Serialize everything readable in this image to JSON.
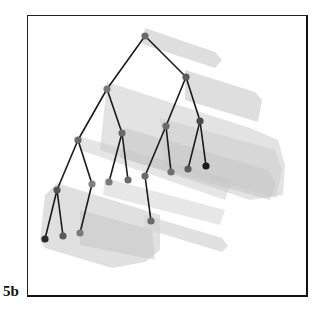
{
  "figure": {
    "label": "5b",
    "type": "3D tree with translucent cylinder/box segments",
    "colors": {
      "edge": "#1a1a1a",
      "node_fill": "#6f6f6f",
      "leaf_dark": "#1a1a1a",
      "shadow_light": "#d0d0d0",
      "frame": "#1a1a1a"
    }
  },
  "tree": {
    "nodes": [
      {
        "id": "root",
        "x": 145,
        "y": 36,
        "shade": "#6a6a6a"
      },
      {
        "id": "l1",
        "x": 107,
        "y": 89,
        "shade": "#7a7a7a"
      },
      {
        "id": "r1",
        "x": 186,
        "y": 77,
        "shade": "#5c5c5c"
      },
      {
        "id": "ll",
        "x": 78,
        "y": 140,
        "shade": "#6a6a6a"
      },
      {
        "id": "lr",
        "x": 122,
        "y": 133,
        "shade": "#6a6a6a"
      },
      {
        "id": "lr_a",
        "x": 109,
        "y": 182,
        "shade": "#7a7a7a"
      },
      {
        "id": "lr_b",
        "x": 128,
        "y": 180,
        "shade": "#6a6a6a"
      },
      {
        "id": "lll",
        "x": 57,
        "y": 190,
        "shade": "#555555"
      },
      {
        "id": "llr",
        "x": 92,
        "y": 184,
        "shade": "#808080"
      },
      {
        "id": "lll_a",
        "x": 45,
        "y": 239,
        "shade": "#2a2a2a"
      },
      {
        "id": "lll_b",
        "x": 63,
        "y": 236,
        "shade": "#5a5a5a"
      },
      {
        "id": "llr_a",
        "x": 80,
        "y": 233,
        "shade": "#7a7a7a"
      },
      {
        "id": "r1l",
        "x": 166,
        "y": 126,
        "shade": "#6a6a6a"
      },
      {
        "id": "r1r",
        "x": 200,
        "y": 121,
        "shade": "#4a4a4a"
      },
      {
        "id": "r1l_a",
        "x": 145,
        "y": 176,
        "shade": "#6a6a6a"
      },
      {
        "id": "r1l_a_a",
        "x": 151,
        "y": 221,
        "shade": "#6a6a6a"
      },
      {
        "id": "r1l_b",
        "x": 171,
        "y": 172,
        "shade": "#707070"
      },
      {
        "id": "r1r_a",
        "x": 188,
        "y": 169,
        "shade": "#5a5a5a"
      },
      {
        "id": "r1r_b",
        "x": 206,
        "y": 166,
        "shade": "#1a1a1a"
      }
    ],
    "edges": [
      [
        "root",
        "l1"
      ],
      [
        "root",
        "r1"
      ],
      [
        "l1",
        "ll"
      ],
      [
        "l1",
        "lr"
      ],
      [
        "lr",
        "lr_a"
      ],
      [
        "lr",
        "lr_b"
      ],
      [
        "ll",
        "lll"
      ],
      [
        "ll",
        "llr"
      ],
      [
        "lll",
        "lll_a"
      ],
      [
        "lll",
        "lll_b"
      ],
      [
        "llr",
        "llr_a"
      ],
      [
        "r1",
        "r1l"
      ],
      [
        "r1",
        "r1r"
      ],
      [
        "r1l",
        "r1l_a"
      ],
      [
        "r1l",
        "r1l_b"
      ],
      [
        "r1l_a",
        "r1l_a_a"
      ],
      [
        "r1r",
        "r1r_a"
      ],
      [
        "r1r",
        "r1r_b"
      ]
    ],
    "shadows": [
      {
        "points": "145,28 215,52 222,60 215,68 142,44",
        "fill": "#d8d8d8",
        "opacity": 0.85
      },
      {
        "points": "185,70 255,92 262,100 258,122 185,100",
        "fill": "#d0d0d0",
        "opacity": 0.7
      },
      {
        "points": "107,82 250,128 278,140 285,165 283,195 250,200 100,150",
        "fill": "#cccccc",
        "opacity": 0.55
      },
      {
        "points": "125,128 268,170 276,185 270,200 120,158",
        "fill": "#c4c4c4",
        "opacity": 0.5
      },
      {
        "points": "160,118 275,150 282,170 276,198 165,165",
        "fill": "#c8c8c8",
        "opacity": 0.45
      },
      {
        "points": "78,136 80,150 225,200 232,180",
        "fill": "#c6c6c6",
        "opacity": 0.45
      },
      {
        "points": "105,178 225,210 220,225 103,195",
        "fill": "#cfcfcf",
        "opacity": 0.5
      },
      {
        "points": "57,183 160,215 160,250 145,262 112,268 45,248 40,240 45,195",
        "fill": "#cbcbcb",
        "opacity": 0.6
      },
      {
        "points": "80,210 152,230 155,260 80,245",
        "fill": "#c0c0c0",
        "opacity": 0.45
      },
      {
        "points": "145,215 222,238 228,246 222,252 143,228",
        "fill": "#d4d4d4",
        "opacity": 0.7
      }
    ]
  }
}
